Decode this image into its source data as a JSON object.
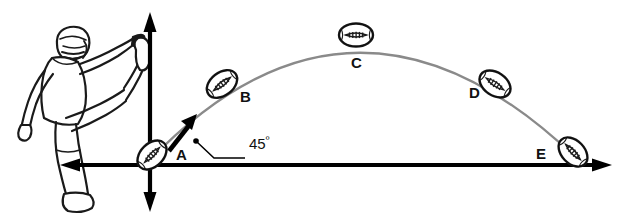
{
  "diagram": {
    "colors": {
      "ink": "#111111",
      "axis": "#000000",
      "trajectory": "#8a8a8a",
      "ball_outline": "#1a1a1a",
      "background": "#ffffff"
    },
    "axes": {
      "origin": {
        "x": 150,
        "y": 165
      },
      "horizontal": {
        "from_x": 60,
        "to_x": 612,
        "arrow_left": true,
        "arrow_right": true
      },
      "vertical": {
        "from_y": 12,
        "to_y": 212,
        "arrow_up": true,
        "arrow_down": true
      }
    },
    "angle_annotation": {
      "label": "45",
      "degree_symbol": "º",
      "value": 45,
      "unit": "degrees",
      "leader_dot": {
        "x": 196,
        "y": 141
      },
      "leader_elbow": {
        "x": 213,
        "y": 157
      },
      "leader_end": {
        "x": 243,
        "y": 157
      }
    },
    "velocity_vector": {
      "name": "initial-velocity-arrow",
      "from": {
        "x": 170,
        "y": 150
      },
      "to": {
        "x": 196,
        "y": 117
      },
      "angle_deg": 45
    },
    "kicker": {
      "name": "football-kicker",
      "description": "Football player in helmet kicking, leg raised in follow-through"
    },
    "trajectory": {
      "type": "parabola",
      "start": {
        "x": 152,
        "y": 158
      },
      "apex": {
        "x": 355,
        "y": 36
      },
      "end": {
        "x": 573,
        "y": 155
      }
    },
    "balls": [
      {
        "label": "A",
        "cx": 152,
        "cy": 155,
        "rotation": -45,
        "label_x": 176,
        "label_y": 147,
        "position": "launch-at-origin"
      },
      {
        "label": "B",
        "cx": 222,
        "cy": 84,
        "rotation": -38,
        "label_x": 240,
        "label_y": 89,
        "position": "ascending"
      },
      {
        "label": "C",
        "cx": 356,
        "cy": 35,
        "rotation": 0,
        "label_x": 351,
        "label_y": 55,
        "position": "apex"
      },
      {
        "label": "D",
        "cx": 495,
        "cy": 84,
        "rotation": 34,
        "label_x": 469,
        "label_y": 85,
        "position": "descending"
      },
      {
        "label": "E",
        "cx": 573,
        "cy": 152,
        "rotation": 46,
        "label_x": 536,
        "label_y": 146,
        "position": "landing"
      }
    ]
  }
}
